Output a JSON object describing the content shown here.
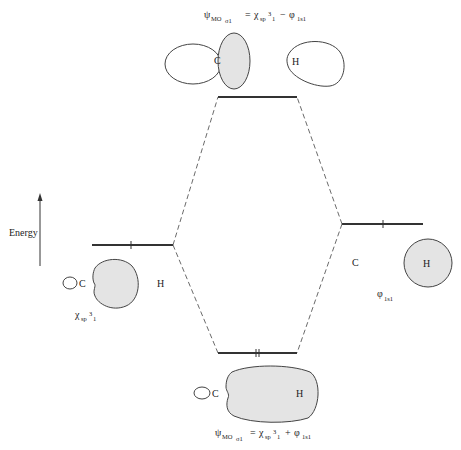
{
  "diagram": {
    "energy_axis": {
      "label": "Energy",
      "direction": "up"
    },
    "antibonding": {
      "psi": "ψ",
      "psi_sub": "MO",
      "psi_subsub": "σ1",
      "equals": "=",
      "chi": "χ",
      "chi_sub": "sp",
      "chi_sup": "3",
      "chi_sub2": "1",
      "operator": "−",
      "phi": "φ",
      "phi_sub": "1s1",
      "atom_c": "C",
      "atom_h": "H",
      "electrons": 0
    },
    "carbon_orbital": {
      "label_chi": "χ",
      "label_sub": "sp",
      "label_sup": "3",
      "label_sub2": "1",
      "atom_c": "C",
      "atom_h": "H",
      "electrons": 1
    },
    "hydrogen_orbital": {
      "label_phi": "φ",
      "label_sub": "1s1",
      "atom_c": "C",
      "atom_h": "H",
      "electrons": 1
    },
    "bonding": {
      "psi": "ψ",
      "psi_sub": "MO",
      "psi_subsub": "σ1",
      "equals": "=",
      "chi": "χ",
      "chi_sub": "sp",
      "chi_sup": "3",
      "chi_sub2": "1",
      "operator": "+",
      "phi": "φ",
      "phi_sub": "1s1",
      "atom_c": "C",
      "atom_h": "H",
      "electrons": 2
    },
    "colors": {
      "orbital_fill": "#e4e4e4",
      "line": "#333333",
      "background": "#ffffff"
    }
  }
}
